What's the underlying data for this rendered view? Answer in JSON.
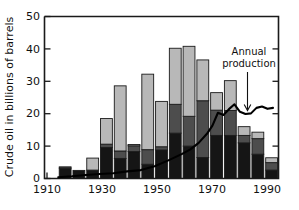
{
  "chart_data": {
    "type": "bar",
    "title": "",
    "subtitle": "",
    "xlabel": "",
    "ylabel": "Crude oil in billions of barrels",
    "xlim": [
      1910,
      1995
    ],
    "ylim": [
      0,
      50
    ],
    "grid": false,
    "legend_position": "none",
    "x_ticks": [
      1910,
      1930,
      1950,
      1970,
      1990
    ],
    "x_tick_labels": [
      "1910",
      "1930",
      "1950",
      "1970",
      "1990"
    ],
    "y_ticks": [
      0,
      10,
      20,
      30,
      40,
      50
    ],
    "y_tick_labels": [
      "0",
      "10",
      "20",
      "30",
      "40",
      "50"
    ],
    "categories": [
      1915,
      1920,
      1925,
      1930,
      1935,
      1940,
      1945,
      1950,
      1955,
      1960,
      1965,
      1970,
      1975,
      1980,
      1985,
      1990
    ],
    "series": [
      {
        "name": "cumulative-production",
        "shade": "black",
        "color": "#151515",
        "values": [
          3.2,
          2.5,
          2.6,
          9.6,
          6.2,
          8.3,
          4.4,
          8.8,
          14.0,
          10.0,
          6.5,
          13.3,
          13.3,
          11.0,
          7.5,
          2.6
        ]
      },
      {
        "name": "mid-segment",
        "shade": "dark-gray",
        "color": "#4d4d4d",
        "values": [
          0.4,
          0.0,
          0.0,
          1.0,
          2.3,
          1.8,
          4.5,
          1.0,
          8.9,
          9.2,
          17.5,
          7.8,
          7.7,
          2.3,
          4.8,
          2.3
        ]
      },
      {
        "name": "reserves",
        "shade": "light-gray",
        "color": "#b8b8b8",
        "values": [
          0.0,
          0.0,
          3.7,
          7.9,
          20.1,
          0.4,
          23.3,
          14.0,
          17.3,
          21.6,
          12.6,
          5.4,
          9.2,
          2.7,
          2.0,
          1.5
        ]
      }
    ],
    "stack_totals": [
      3.6,
      2.5,
      6.3,
      18.5,
      28.6,
      10.5,
      32.2,
      23.8,
      40.2,
      40.8,
      36.6,
      26.5,
      30.2,
      16.0,
      14.3,
      6.4
    ],
    "line_series": {
      "name": "Annual production",
      "x": [
        1915,
        1920,
        1925,
        1930,
        1935,
        1940,
        1945,
        1950,
        1955,
        1960,
        1963,
        1966,
        1969,
        1971,
        1973,
        1975,
        1977,
        1979,
        1981,
        1983,
        1985,
        1987,
        1989,
        1991,
        1993
      ],
      "y": [
        0.4,
        0.7,
        1.1,
        1.4,
        1.6,
        2.2,
        2.6,
        3.8,
        5.6,
        7.6,
        9.0,
        11.0,
        13.8,
        16.3,
        20.3,
        19.6,
        21.4,
        22.9,
        20.6,
        19.9,
        20.1,
        21.8,
        22.2,
        21.5,
        21.8
      ]
    },
    "annotations": [
      {
        "name": "annual-production-callout",
        "line1": "Annual",
        "line2": "production",
        "arrow": "down-arrow"
      }
    ]
  }
}
